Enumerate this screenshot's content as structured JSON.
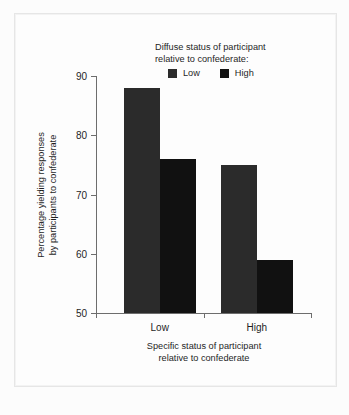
{
  "chart_data": {
    "type": "bar",
    "title": "",
    "categories": [
      "Low",
      "High"
    ],
    "series": [
      {
        "name": "Low",
        "values": [
          88,
          75
        ],
        "color": "#2b2b2b"
      },
      {
        "name": "High",
        "values": [
          76,
          59
        ],
        "color": "#111111"
      }
    ],
    "xlabel": "Specific status of participant relative to confederate",
    "ylabel": "Percentage yielding responses by participants to confederate",
    "ylim": [
      50,
      90
    ],
    "yticks": [
      50,
      60,
      70,
      80,
      90
    ],
    "ytick_labels": [
      "50",
      "60",
      "70",
      "80",
      "90"
    ],
    "grid": false,
    "legend_position": "top-right"
  },
  "legend": {
    "caption_line1": "Diffuse status of participant",
    "caption_line2": "relative to confederate:",
    "entries": [
      {
        "label": "Low",
        "color": "#2b2b2b"
      },
      {
        "label": "High",
        "color": "#111111"
      }
    ]
  },
  "axes": {
    "y_title_line1": "Percentage yielding responses",
    "y_title_line2": "by participants to confederate",
    "x_title_line1": "Specific status of participant",
    "x_title_line2": "relative to confederate",
    "x_categories": [
      "Low",
      "High"
    ],
    "y_tick_labels": [
      "90",
      "80",
      "70",
      "60",
      "50"
    ]
  },
  "colors": {
    "background": "#fcfcfc",
    "frame": "#e6e6e6",
    "axis": "#6d6d6d",
    "text": "#1f1f1f",
    "bar_low": "#2b2b2b",
    "bar_high": "#111111"
  }
}
